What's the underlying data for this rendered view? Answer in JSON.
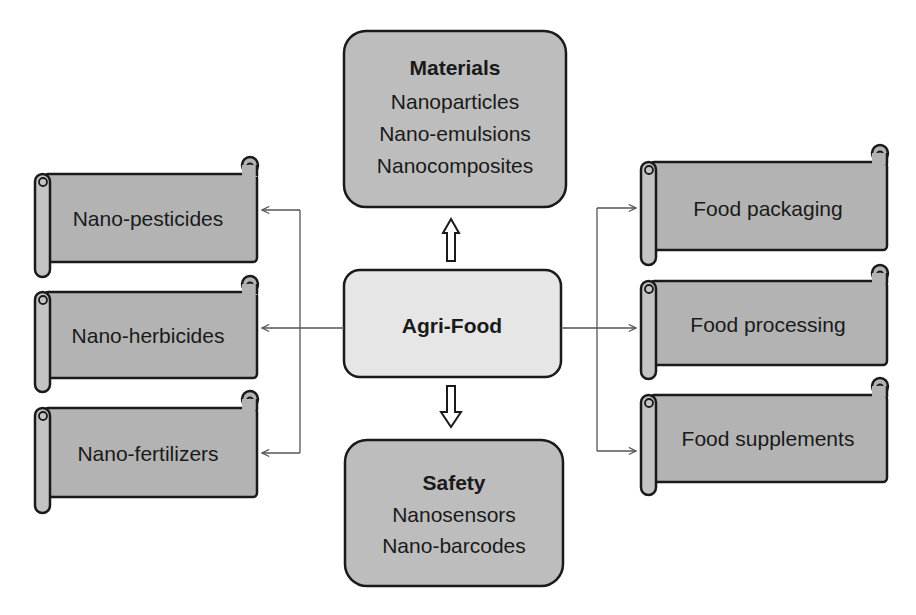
{
  "center": {
    "label": "Agri-Food",
    "fill": "#e6e6e6"
  },
  "top_box": {
    "title": "Materials",
    "items": [
      "Nanoparticles",
      "Nano-emulsions",
      "Nanocomposites"
    ],
    "fill": "#bdbdbd"
  },
  "bottom_box": {
    "title": "Safety",
    "items": [
      "Nanosensors",
      "Nano-barcodes"
    ],
    "fill": "#bdbdbd"
  },
  "left_scrolls": [
    {
      "label": "Nano-pesticides"
    },
    {
      "label": "Nano-herbicides"
    },
    {
      "label": "Nano-fertilizers"
    }
  ],
  "right_scrolls": [
    {
      "label": "Food packaging"
    },
    {
      "label": "Food processing"
    },
    {
      "label": "Food supplements"
    }
  ],
  "colors": {
    "scroll_fill": "#b3b3b3",
    "stroke": "#1a1a1a",
    "connector": "#555555"
  }
}
